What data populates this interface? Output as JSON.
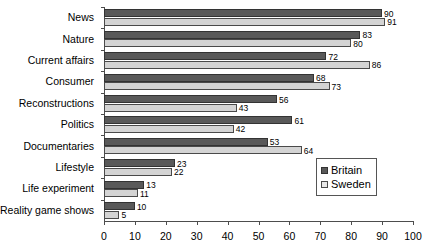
{
  "chart_data": {
    "type": "bar",
    "orientation": "horizontal",
    "title": "",
    "xlabel": "",
    "ylabel": "",
    "xlim": [
      0,
      100
    ],
    "xticks": [
      0,
      10,
      20,
      30,
      40,
      50,
      60,
      70,
      80,
      90,
      100
    ],
    "grid": false,
    "legend_position": "inside-right",
    "categories": [
      "News",
      "Nature",
      "Current affairs",
      "Consumer",
      "Reconstructions",
      "Politics",
      "Documentaries",
      "Lifestyle",
      "Life experiment",
      "Reality game shows"
    ],
    "series": [
      {
        "name": "Britain",
        "color": "#595959",
        "values": [
          90,
          83,
          72,
          68,
          56,
          61,
          53,
          23,
          13,
          10
        ]
      },
      {
        "name": "Sweden",
        "color": "#d4d4d4",
        "values": [
          91,
          80,
          86,
          73,
          43,
          42,
          64,
          22,
          11,
          5
        ]
      }
    ]
  },
  "legend": {
    "items": [
      {
        "label": "Britain",
        "key": "britain"
      },
      {
        "label": "Sweden",
        "key": "sweden"
      }
    ]
  }
}
